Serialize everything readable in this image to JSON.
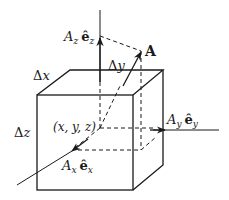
{
  "diagram": {
    "labels": {
      "Az": "A",
      "Az_sub": "z",
      "ez_hat": "ê",
      "ez_sub": "z",
      "A_vector": "A",
      "delta_y": "Δy",
      "delta_x": "Δx",
      "delta_z": "Δz",
      "point": "(x, y, z)",
      "Ay": "A",
      "Ay_sub": "y",
      "ey_hat": "ê",
      "ey_sub": "y",
      "Ax": "A",
      "Ax_sub": "x",
      "ex_hat": "ê",
      "ex_sub": "x"
    },
    "colors": {
      "line": "#1a1a1a",
      "background": "#ffffff"
    }
  }
}
